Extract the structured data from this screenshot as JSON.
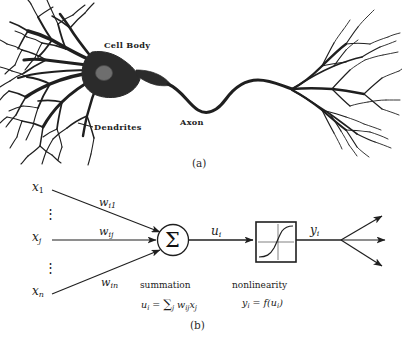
{
  "figure": {
    "panel_a": {
      "caption": "(a)",
      "labels": {
        "cell_body": "Cell Body",
        "dendrites": "Dendrites",
        "axon": "Axon"
      }
    },
    "panel_b": {
      "caption": "(b)",
      "inputs": [
        {
          "base": "x",
          "sub": "1"
        },
        {
          "base": "x",
          "sub": "j"
        },
        {
          "base": "x",
          "sub": "n"
        }
      ],
      "vdots": "⋮",
      "weights": [
        {
          "base": "w",
          "sub": "i1"
        },
        {
          "base": "w",
          "sub": "ij"
        },
        {
          "base": "w",
          "sub": "in"
        }
      ],
      "sigma_symbol": "Σ",
      "net_input": {
        "base": "u",
        "sub": "i"
      },
      "output": {
        "base": "y",
        "sub": "i"
      },
      "summation": {
        "title": "summation",
        "formula_html": "u<span class=\"sub\">i</span> <span class=\"op\">=</span> <span class=\"big\">∑</span><span class=\"sub\">j</span> w<span class=\"sub\">ij</span>x<span class=\"sub\">j</span>"
      },
      "nonlinearity": {
        "title": "nonlinearity",
        "formula_html": "y<span class=\"sub\">i</span> <span class=\"op\">=</span> f(u<span class=\"sub\">i</span>)"
      }
    }
  },
  "colors": {
    "ink": "#1a1a1a",
    "soma_fill": "#2b2b2b",
    "nucleus_fill": "#6e6e6e",
    "background": "#ffffff",
    "line": "#222222"
  }
}
